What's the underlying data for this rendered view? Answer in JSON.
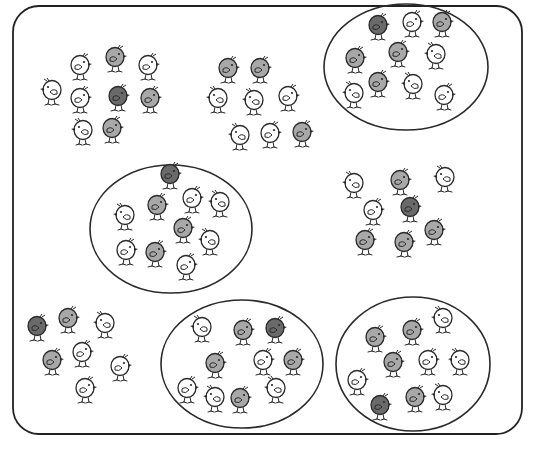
{
  "figure": {
    "frame": {
      "x": 13,
      "y": 6,
      "width": 509,
      "height": 428,
      "radius": 26,
      "stroke": "#222222"
    },
    "colors": {
      "line": "#2a2a2a",
      "dark_fill": "#6a6a6a",
      "mid_fill": "#a8a8a8",
      "light_fill": "#ffffff"
    },
    "total_chicks": 80,
    "chicks_per_group": 10,
    "groups": [
      {
        "id": "group-top-left",
        "circled": false,
        "chicks": [
          {
            "x": 80,
            "y": 65,
            "shade": "light",
            "dir": 1
          },
          {
            "x": 115,
            "y": 57,
            "shade": "mid",
            "dir": 1
          },
          {
            "x": 148,
            "y": 65,
            "shade": "light",
            "dir": 1
          },
          {
            "x": 52,
            "y": 90,
            "shade": "light",
            "dir": -1
          },
          {
            "x": 80,
            "y": 98,
            "shade": "light",
            "dir": 1
          },
          {
            "x": 118,
            "y": 96,
            "shade": "dark",
            "dir": 1
          },
          {
            "x": 150,
            "y": 98,
            "shade": "mid",
            "dir": 1
          },
          {
            "x": 83,
            "y": 130,
            "shade": "light",
            "dir": -1
          },
          {
            "x": 112,
            "y": 128,
            "shade": "mid",
            "dir": 1
          },
          {
            "x": 100,
            "y": 80,
            "shade": "none",
            "dir": 0
          }
        ]
      },
      {
        "id": "group-top-middle",
        "circled": false,
        "chicks": [
          {
            "x": 228,
            "y": 68,
            "shade": "mid",
            "dir": 1
          },
          {
            "x": 260,
            "y": 68,
            "shade": "mid",
            "dir": 1
          },
          {
            "x": 218,
            "y": 98,
            "shade": "light",
            "dir": -1
          },
          {
            "x": 254,
            "y": 100,
            "shade": "light",
            "dir": -1
          },
          {
            "x": 288,
            "y": 96,
            "shade": "light",
            "dir": 1
          },
          {
            "x": 240,
            "y": 135,
            "shade": "light",
            "dir": -1
          },
          {
            "x": 270,
            "y": 133,
            "shade": "light",
            "dir": 1
          },
          {
            "x": 302,
            "y": 132,
            "shade": "mid",
            "dir": 1
          },
          {
            "x": 330,
            "y": 122,
            "shade": "none",
            "dir": 0
          },
          {
            "x": 330,
            "y": 122,
            "shade": "none",
            "dir": 0
          }
        ]
      },
      {
        "id": "group-top-right",
        "circled": true,
        "ellipse": {
          "cx": 406,
          "cy": 67,
          "rx": 82,
          "ry": 63
        },
        "chicks": [
          {
            "x": 378,
            "y": 25,
            "shade": "dark",
            "dir": 1
          },
          {
            "x": 412,
            "y": 22,
            "shade": "light",
            "dir": 1
          },
          {
            "x": 442,
            "y": 22,
            "shade": "mid",
            "dir": 1
          },
          {
            "x": 355,
            "y": 58,
            "shade": "mid",
            "dir": 1
          },
          {
            "x": 398,
            "y": 52,
            "shade": "mid",
            "dir": 1
          },
          {
            "x": 436,
            "y": 54,
            "shade": "light",
            "dir": -1
          },
          {
            "x": 354,
            "y": 93,
            "shade": "light",
            "dir": -1
          },
          {
            "x": 378,
            "y": 82,
            "shade": "mid",
            "dir": 1
          },
          {
            "x": 413,
            "y": 84,
            "shade": "light",
            "dir": -1
          },
          {
            "x": 444,
            "y": 95,
            "shade": "light",
            "dir": 1
          }
        ]
      },
      {
        "id": "group-middle-left",
        "circled": true,
        "ellipse": {
          "cx": 171,
          "cy": 229,
          "rx": 81,
          "ry": 64
        },
        "chicks": [
          {
            "x": 170,
            "y": 174,
            "shade": "dark",
            "dir": 1
          },
          {
            "x": 157,
            "y": 205,
            "shade": "mid",
            "dir": 1
          },
          {
            "x": 192,
            "y": 198,
            "shade": "light",
            "dir": 1
          },
          {
            "x": 220,
            "y": 202,
            "shade": "light",
            "dir": -1
          },
          {
            "x": 125,
            "y": 215,
            "shade": "light",
            "dir": -1
          },
          {
            "x": 183,
            "y": 228,
            "shade": "mid",
            "dir": 1
          },
          {
            "x": 210,
            "y": 240,
            "shade": "light",
            "dir": -1
          },
          {
            "x": 126,
            "y": 250,
            "shade": "light",
            "dir": 1
          },
          {
            "x": 155,
            "y": 252,
            "shade": "mid",
            "dir": 1
          },
          {
            "x": 186,
            "y": 265,
            "shade": "light",
            "dir": 1
          }
        ]
      },
      {
        "id": "group-middle-right",
        "circled": false,
        "chicks": [
          {
            "x": 354,
            "y": 183,
            "shade": "light",
            "dir": -1
          },
          {
            "x": 400,
            "y": 180,
            "shade": "mid",
            "dir": 1
          },
          {
            "x": 445,
            "y": 177,
            "shade": "light",
            "dir": -1
          },
          {
            "x": 373,
            "y": 210,
            "shade": "light",
            "dir": 1
          },
          {
            "x": 410,
            "y": 207,
            "shade": "dark",
            "dir": 1
          },
          {
            "x": 434,
            "y": 230,
            "shade": "mid",
            "dir": 1
          },
          {
            "x": 365,
            "y": 240,
            "shade": "mid",
            "dir": 1
          },
          {
            "x": 404,
            "y": 242,
            "shade": "mid",
            "dir": 1
          },
          {
            "x": 520,
            "y": 290,
            "shade": "none",
            "dir": 0
          },
          {
            "x": 520,
            "y": 290,
            "shade": "none",
            "dir": 0
          }
        ]
      },
      {
        "id": "group-bottom-left",
        "circled": false,
        "chicks": [
          {
            "x": 37,
            "y": 326,
            "shade": "dark",
            "dir": 1
          },
          {
            "x": 68,
            "y": 318,
            "shade": "mid",
            "dir": 1
          },
          {
            "x": 105,
            "y": 323,
            "shade": "light",
            "dir": -1
          },
          {
            "x": 52,
            "y": 360,
            "shade": "mid",
            "dir": 1
          },
          {
            "x": 82,
            "y": 352,
            "shade": "light",
            "dir": 1
          },
          {
            "x": 120,
            "y": 366,
            "shade": "light",
            "dir": 1
          },
          {
            "x": 85,
            "y": 388,
            "shade": "light",
            "dir": 1
          },
          {
            "x": 40,
            "y": 400,
            "shade": "none",
            "dir": 0
          },
          {
            "x": 40,
            "y": 400,
            "shade": "none",
            "dir": 0
          },
          {
            "x": 40,
            "y": 400,
            "shade": "none",
            "dir": 0
          }
        ]
      },
      {
        "id": "group-bottom-middle",
        "circled": true,
        "ellipse": {
          "cx": 242,
          "cy": 364,
          "rx": 81,
          "ry": 64
        },
        "chicks": [
          {
            "x": 202,
            "y": 327,
            "shade": "light",
            "dir": -1
          },
          {
            "x": 243,
            "y": 330,
            "shade": "mid",
            "dir": 1
          },
          {
            "x": 275,
            "y": 328,
            "shade": "dark",
            "dir": 1
          },
          {
            "x": 215,
            "y": 363,
            "shade": "mid",
            "dir": 1
          },
          {
            "x": 263,
            "y": 360,
            "shade": "light",
            "dir": 1
          },
          {
            "x": 293,
            "y": 360,
            "shade": "mid",
            "dir": 1
          },
          {
            "x": 187,
            "y": 388,
            "shade": "light",
            "dir": 1
          },
          {
            "x": 215,
            "y": 397,
            "shade": "light",
            "dir": -1
          },
          {
            "x": 240,
            "y": 398,
            "shade": "mid",
            "dir": 1
          },
          {
            "x": 276,
            "y": 388,
            "shade": "light",
            "dir": -1
          }
        ]
      },
      {
        "id": "group-bottom-right",
        "circled": true,
        "ellipse": {
          "cx": 413,
          "cy": 364,
          "rx": 77,
          "ry": 67
        },
        "chicks": [
          {
            "x": 443,
            "y": 318,
            "shade": "light",
            "dir": -1
          },
          {
            "x": 375,
            "y": 337,
            "shade": "mid",
            "dir": 1
          },
          {
            "x": 412,
            "y": 330,
            "shade": "mid",
            "dir": 1
          },
          {
            "x": 393,
            "y": 362,
            "shade": "mid",
            "dir": 1
          },
          {
            "x": 428,
            "y": 360,
            "shade": "light",
            "dir": 1
          },
          {
            "x": 460,
            "y": 360,
            "shade": "light",
            "dir": -1
          },
          {
            "x": 357,
            "y": 380,
            "shade": "light",
            "dir": 1
          },
          {
            "x": 380,
            "y": 405,
            "shade": "dark",
            "dir": 1
          },
          {
            "x": 415,
            "y": 397,
            "shade": "mid",
            "dir": 1
          },
          {
            "x": 443,
            "y": 395,
            "shade": "light",
            "dir": -1
          }
        ]
      }
    ]
  }
}
